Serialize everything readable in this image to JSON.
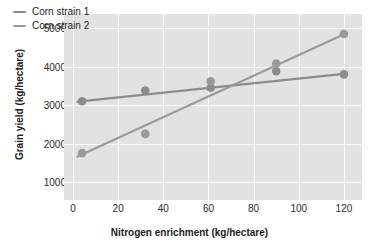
{
  "chart_data": {
    "type": "scatter",
    "title": "",
    "xlabel": "Nitrogen enrichment (kg/hectare)",
    "ylabel": "Grain yield (kg/hectare)",
    "xlim": [
      -4,
      128
    ],
    "ylim": [
      530,
      5370
    ],
    "xticks": [
      0,
      20,
      40,
      60,
      80,
      100,
      120
    ],
    "yticks": [
      1000,
      2000,
      3000,
      4000,
      5000
    ],
    "grid": true,
    "legend_position": "top-left",
    "series": [
      {
        "name": "Corn strain 1",
        "color": "#8c8c8c",
        "points": [
          {
            "x": 4,
            "y": 3100
          },
          {
            "x": 32,
            "y": 3380
          },
          {
            "x": 61,
            "y": 3450
          },
          {
            "x": 90,
            "y": 3880
          },
          {
            "x": 120,
            "y": 3800
          }
        ],
        "fit_line": {
          "x0": 2,
          "y0": 3090,
          "x1": 121,
          "y1": 3820
        }
      },
      {
        "name": "Corn strain 2",
        "color": "#9a9a9a",
        "points": [
          {
            "x": 4,
            "y": 1750
          },
          {
            "x": 32,
            "y": 2250
          },
          {
            "x": 61,
            "y": 3620
          },
          {
            "x": 90,
            "y": 4080
          },
          {
            "x": 120,
            "y": 4850
          }
        ],
        "fit_line": {
          "x0": 2,
          "y0": 1660,
          "x1": 121,
          "y1": 4870
        }
      }
    ]
  },
  "legend": {
    "entries": [
      {
        "label": "Corn strain 1"
      },
      {
        "label": "Corn strain 2"
      }
    ]
  },
  "axes": {
    "x_tick_labels": [
      "0",
      "20",
      "40",
      "60",
      "80",
      "100",
      "120"
    ],
    "y_tick_labels": [
      "1000",
      "2000",
      "3000",
      "4000",
      "5000"
    ]
  },
  "colors": {
    "plot_background": "#e2e2e2",
    "gridline": "#fbfbfb",
    "series_gray": "#8c8c8c",
    "text": "#1d1d1d"
  }
}
